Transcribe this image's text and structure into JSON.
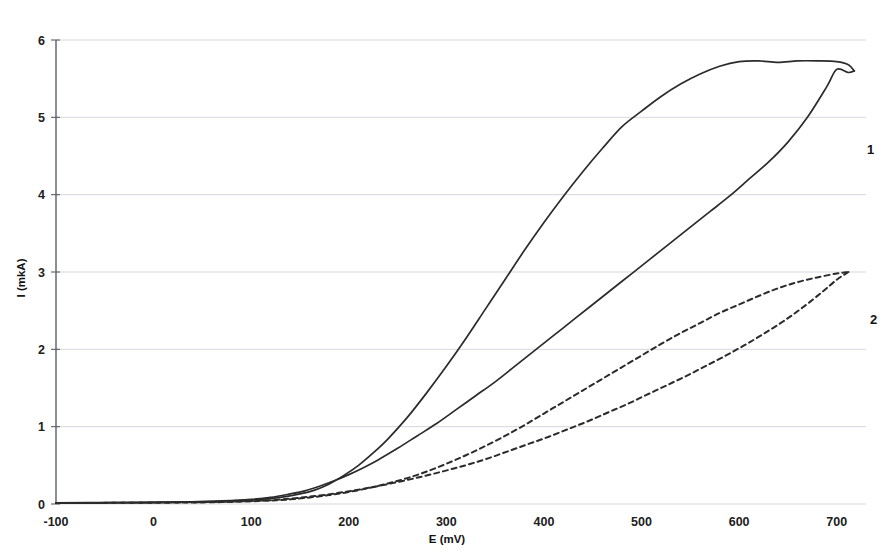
{
  "chart_data": {
    "type": "line",
    "title": "",
    "subtitle": "",
    "xlabel": "E (mV)",
    "ylabel": "I (mkA)",
    "xlim": [
      -100,
      730
    ],
    "ylim": [
      0,
      6
    ],
    "xticks": [
      -100,
      0,
      100,
      200,
      300,
      400,
      500,
      600,
      700
    ],
    "xticklabels": [
      "-100",
      "0",
      "100",
      "200",
      "300",
      "400",
      "500",
      "600",
      "700"
    ],
    "yticks": [
      0,
      1,
      2,
      3,
      4,
      5,
      6
    ],
    "yticklabels": [
      "0",
      "1",
      "2",
      "3",
      "4",
      "5",
      "6"
    ],
    "grid": "horizontal",
    "legend": "inline-annotations",
    "annotations": [
      {
        "text": "1",
        "x": 700,
        "y": 4.52,
        "name": "curve-1-label"
      },
      {
        "text": "2",
        "x": 703,
        "y": 2.33,
        "name": "curve-2-label"
      }
    ],
    "series": [
      {
        "name": "1",
        "style": "solid",
        "description": "Curve 1 — anodic/cathodic hysteresis loop, solid line, peak ~5.75 mkA",
        "forward_x": [
          -100,
          -50,
          0,
          40,
          80,
          110,
          130,
          150,
          165,
          180,
          195,
          210,
          225,
          240,
          260,
          280,
          300,
          320,
          340,
          360,
          380,
          400,
          420,
          440,
          460,
          480,
          500,
          520,
          540,
          560,
          580,
          600,
          620,
          640,
          660,
          680,
          700,
          712,
          718
        ],
        "forward_y": [
          0.015,
          0.018,
          0.022,
          0.028,
          0.04,
          0.06,
          0.085,
          0.13,
          0.18,
          0.26,
          0.37,
          0.5,
          0.66,
          0.84,
          1.12,
          1.44,
          1.78,
          2.14,
          2.52,
          2.9,
          3.28,
          3.64,
          3.98,
          4.3,
          4.6,
          4.88,
          5.08,
          5.27,
          5.43,
          5.56,
          5.66,
          5.72,
          5.73,
          5.71,
          5.73,
          5.73,
          5.72,
          5.68,
          5.6
        ],
        "reverse_x": [
          718,
          712,
          700,
          690,
          670,
          650,
          630,
          610,
          590,
          570,
          550,
          530,
          510,
          490,
          470,
          450,
          430,
          410,
          390,
          370,
          350,
          330,
          310,
          290,
          270,
          250,
          230,
          215,
          200,
          185,
          170,
          155,
          140,
          120,
          100,
          60,
          0,
          -60,
          -100
        ],
        "reverse_y": [
          5.6,
          5.58,
          5.62,
          5.4,
          5.0,
          4.68,
          4.42,
          4.2,
          3.98,
          3.78,
          3.58,
          3.38,
          3.18,
          2.98,
          2.78,
          2.58,
          2.38,
          2.18,
          1.98,
          1.78,
          1.58,
          1.4,
          1.22,
          1.04,
          0.88,
          0.72,
          0.57,
          0.47,
          0.38,
          0.3,
          0.23,
          0.17,
          0.13,
          0.085,
          0.06,
          0.035,
          0.022,
          0.016,
          0.014
        ]
      },
      {
        "name": "2",
        "style": "dashed",
        "description": "Curve 2 — hysteresis loop, dashed line, peak ~3.0 mkA",
        "forward_x": [
          -100,
          -40,
          20,
          70,
          110,
          140,
          160,
          180,
          200,
          220,
          240,
          260,
          280,
          300,
          320,
          340,
          360,
          380,
          400,
          420,
          440,
          460,
          480,
          500,
          520,
          540,
          560,
          580,
          600,
          620,
          640,
          660,
          680,
          700,
          712
        ],
        "forward_y": [
          0.012,
          0.015,
          0.018,
          0.025,
          0.04,
          0.06,
          0.085,
          0.115,
          0.155,
          0.205,
          0.265,
          0.335,
          0.42,
          0.52,
          0.63,
          0.75,
          0.88,
          1.02,
          1.17,
          1.32,
          1.47,
          1.62,
          1.77,
          1.92,
          2.07,
          2.21,
          2.34,
          2.47,
          2.58,
          2.69,
          2.79,
          2.87,
          2.93,
          2.98,
          3.0
        ],
        "reverse_x": [
          712,
          700,
          685,
          665,
          645,
          625,
          605,
          585,
          565,
          545,
          525,
          505,
          485,
          465,
          445,
          425,
          405,
          385,
          365,
          345,
          325,
          305,
          285,
          265,
          245,
          225,
          205,
          185,
          165,
          145,
          120,
          80,
          20,
          -40,
          -100
        ],
        "reverse_y": [
          3.0,
          2.9,
          2.74,
          2.54,
          2.36,
          2.2,
          2.05,
          1.91,
          1.78,
          1.65,
          1.53,
          1.41,
          1.29,
          1.18,
          1.07,
          0.97,
          0.87,
          0.78,
          0.69,
          0.6,
          0.52,
          0.45,
          0.385,
          0.325,
          0.27,
          0.22,
          0.175,
          0.135,
          0.102,
          0.075,
          0.05,
          0.03,
          0.02,
          0.015,
          0.012
        ]
      }
    ]
  },
  "colors": {
    "curve": "#2b2b2b",
    "grid": "#c9cdd4",
    "axis": "#5a5f66",
    "background": "#ffffff",
    "text": "#1a1a1a"
  }
}
